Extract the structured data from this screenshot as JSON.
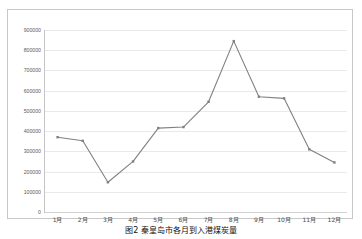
{
  "figure": {
    "caption": "图2  秦皇岛市各月到入港煤炭量",
    "border_color": "#c8c8c8",
    "background": "#ffffff"
  },
  "chart_data": {
    "type": "line",
    "title": "",
    "subtitle": "",
    "xlabel": "",
    "ylabel": "",
    "categories": [
      "1月",
      "2月",
      "3月",
      "4月",
      "5月",
      "6月",
      "7月",
      "8月",
      "9月",
      "10月",
      "11月",
      "12月"
    ],
    "values": [
      370000,
      352000,
      147000,
      250000,
      415000,
      420000,
      545000,
      845000,
      570000,
      562000,
      310000,
      245000
    ],
    "series": [
      {
        "name": "",
        "values": [
          370000,
          352000,
          147000,
          250000,
          415000,
          420000,
          545000,
          845000,
          570000,
          562000,
          310000,
          245000
        ],
        "color": "#808080",
        "marker": "square"
      }
    ],
    "ylim": [
      0,
      900000
    ],
    "ytick_step": 100000,
    "ytick_labels": [
      "900000",
      "800000",
      "700000",
      "600000",
      "500000",
      "400000",
      "300000",
      "200000",
      "100000",
      "0"
    ],
    "ytick_values": [
      900000,
      800000,
      700000,
      600000,
      500000,
      400000,
      300000,
      200000,
      100000,
      0
    ],
    "grid": true,
    "grid_color": "#e9e9e9",
    "legend": false,
    "legend_position": "none",
    "line_color": "#808080",
    "axis_color": "#c4c4c4",
    "annotations": []
  }
}
